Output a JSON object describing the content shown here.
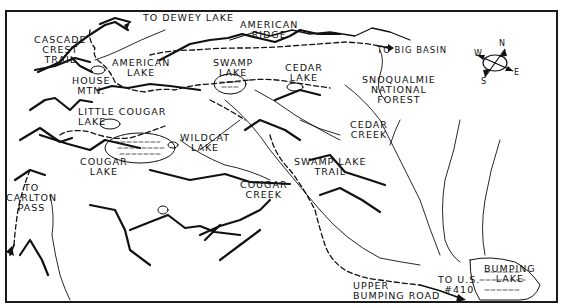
{
  "map": {
    "type": "trail-map",
    "colors": {
      "ink": "#111111",
      "paper": "#ffffff",
      "frame": "#1a1a1a"
    },
    "compass": {
      "N": "N",
      "E": "E",
      "S": "S",
      "W": "W"
    },
    "labels": {
      "to_dewey_lake": "TO DEWEY LAKE",
      "american_ridge": "AMERICAN\nRIDGE",
      "to_big_basin": "TO BIG BASIN",
      "cascade_crest_trail": "CASCADE\nCREST\nTRAIL",
      "american_lake": "AMERICAN\nLAKE",
      "house_mtn": "HOUSE\nMTN.",
      "swamp_lake": "SWAMP\nLAKE",
      "cedar_lake": "CEDAR\nLAKE",
      "snoqualmie_national_forest": "SNOQUALMIE\nNATIONAL\nFOREST",
      "little_cougar_lake": "LITTLE COUGAR\nLAKE",
      "wildcat_lake": "WILDCAT\nLAKE",
      "cedar_creek": "CEDAR\nCREEK",
      "cougar_lake": "COUGAR\nLAKE",
      "to_carlton_pass": "TO\nCARLTON\nPASS",
      "swamp_lake_trail": "SWAMP LAKE\nTRAIL",
      "cougar_creek": "COUGAR\nCREEK",
      "upper_bumping_road": "UPPER\nBUMPING ROAD",
      "to_us_410": "TO U.S.\n#410",
      "bumping_lake": "BUMPING\nLAKE"
    }
  }
}
